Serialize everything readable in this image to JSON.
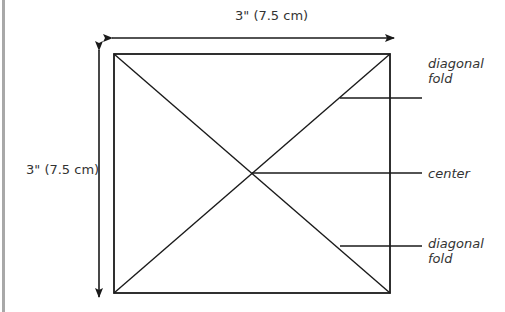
{
  "diagram": {
    "dimensions": {
      "width_label": "3\" (7.5 cm)",
      "height_label": "3\" (7.5 cm)"
    },
    "callouts": [
      {
        "label": "diagonal fold"
      },
      {
        "label": "center"
      },
      {
        "label": "diagonal fold"
      }
    ],
    "colors": {
      "line": "#1a1a1a",
      "text": "#333333",
      "border": "#a8a8a8"
    }
  }
}
